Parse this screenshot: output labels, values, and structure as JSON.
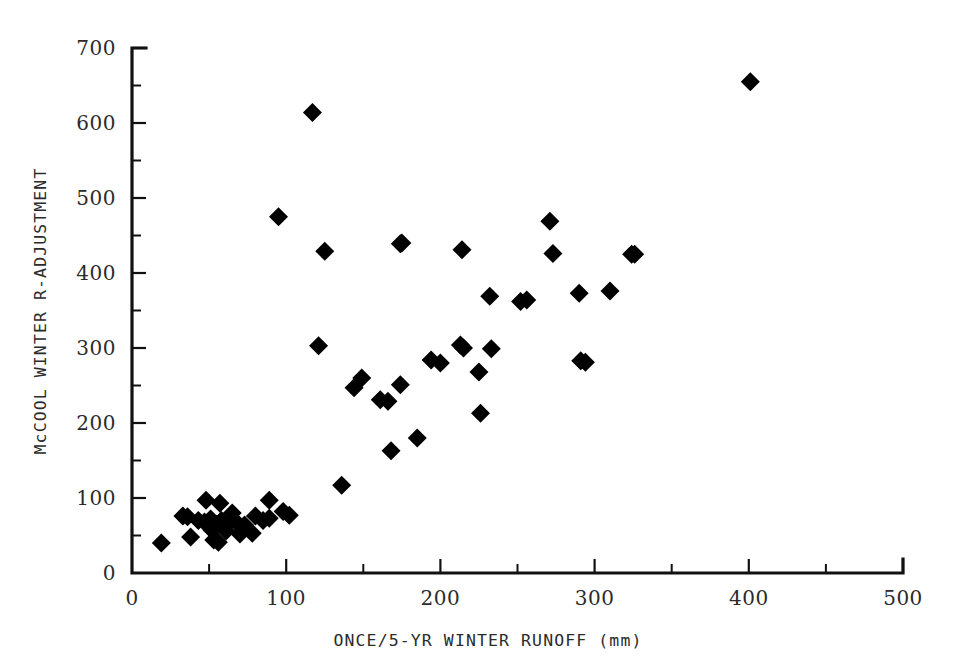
{
  "chart_data": {
    "type": "scatter",
    "title": "",
    "xlabel": "ONCE/5-YR WINTER RUNOFF  (mm)",
    "ylabel": "McCOOL WINTER R-ADJUSTMENT",
    "xlim": [
      0,
      500
    ],
    "ylim": [
      0,
      700
    ],
    "x_ticks": [
      0,
      100,
      200,
      300,
      400,
      500
    ],
    "y_ticks": [
      0,
      100,
      200,
      300,
      400,
      500,
      600,
      700
    ],
    "x_minor_step": 50,
    "y_minor_step": 50,
    "grid": false,
    "legend": false,
    "marker": "filled-diamond",
    "marker_color": "#000000",
    "series": [
      {
        "name": "stations",
        "points": [
          [
            19,
            40
          ],
          [
            33,
            76
          ],
          [
            36,
            75
          ],
          [
            38,
            48
          ],
          [
            43,
            70
          ],
          [
            47,
            68
          ],
          [
            48,
            97
          ],
          [
            50,
            62
          ],
          [
            51,
            72
          ],
          [
            52,
            57
          ],
          [
            53,
            44
          ],
          [
            55,
            65
          ],
          [
            56,
            41
          ],
          [
            57,
            93
          ],
          [
            58,
            70
          ],
          [
            59,
            63
          ],
          [
            61,
            56
          ],
          [
            63,
            68
          ],
          [
            65,
            80
          ],
          [
            68,
            67
          ],
          [
            70,
            52
          ],
          [
            73,
            64
          ],
          [
            78,
            53
          ],
          [
            80,
            76
          ],
          [
            85,
            70
          ],
          [
            89,
            73
          ],
          [
            89,
            97
          ],
          [
            95,
            475
          ],
          [
            98,
            82
          ],
          [
            102,
            77
          ],
          [
            117,
            614
          ],
          [
            121,
            303
          ],
          [
            136,
            117
          ],
          [
            144,
            247
          ],
          [
            149,
            260
          ],
          [
            161,
            231
          ],
          [
            166,
            229
          ],
          [
            168,
            163
          ],
          [
            174,
            251
          ],
          [
            174,
            439
          ],
          [
            185,
            180
          ],
          [
            194,
            284
          ],
          [
            200,
            280
          ],
          [
            213,
            304
          ],
          [
            214,
            431
          ],
          [
            215,
            300
          ],
          [
            225,
            268
          ],
          [
            226,
            213
          ],
          [
            233,
            299
          ],
          [
            232,
            369
          ],
          [
            252,
            362
          ],
          [
            256,
            364
          ],
          [
            271,
            469
          ],
          [
            273,
            426
          ],
          [
            290,
            373
          ],
          [
            291,
            283
          ],
          [
            294,
            281
          ],
          [
            310,
            376
          ],
          [
            324,
            425
          ],
          [
            326,
            425
          ],
          [
            401,
            655
          ],
          [
            125,
            429
          ],
          [
            175,
            440
          ]
        ]
      }
    ]
  },
  "figure": {
    "background_color": "#ffffff",
    "axis_color": "#111111",
    "text_color": "#2b2b2b"
  }
}
